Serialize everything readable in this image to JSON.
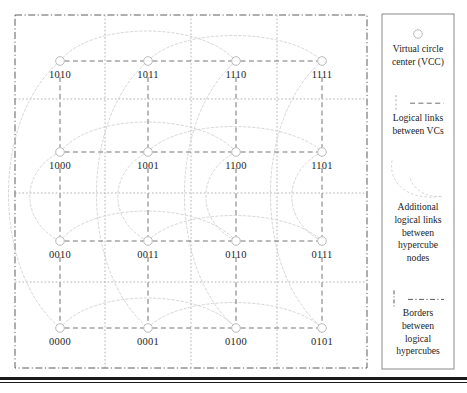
{
  "figure": {
    "type": "network-diagram",
    "title": ""
  },
  "diagram": {
    "grid": {
      "columns": 4,
      "rows": 4,
      "node_x": [
        60,
        148,
        236,
        322
      ],
      "node_y": [
        61,
        152,
        241,
        328
      ],
      "border_box": {
        "x": 15,
        "y": 15,
        "width": 352,
        "height": 353
      },
      "hypercube_border_vlines": [
        105,
        191,
        277
      ],
      "hypercube_border_hlines": [
        99,
        193,
        282
      ]
    },
    "nodes": [
      {
        "id": "1010",
        "label": "1010",
        "col": 0,
        "row": 0
      },
      {
        "id": "1011",
        "label": "1011",
        "col": 1,
        "row": 0
      },
      {
        "id": "1110",
        "label": "1110",
        "col": 2,
        "row": 0
      },
      {
        "id": "1111",
        "label": "1111",
        "col": 3,
        "row": 0
      },
      {
        "id": "1000",
        "label": "1000",
        "col": 0,
        "row": 1
      },
      {
        "id": "1001",
        "label": "1001",
        "col": 1,
        "row": 1
      },
      {
        "id": "1100",
        "label": "1100",
        "col": 2,
        "row": 1
      },
      {
        "id": "1101",
        "label": "1101",
        "col": 3,
        "row": 1
      },
      {
        "id": "0010",
        "label": "0010",
        "col": 0,
        "row": 2
      },
      {
        "id": "0011",
        "label": "0011",
        "col": 1,
        "row": 2
      },
      {
        "id": "0110",
        "label": "0110",
        "col": 2,
        "row": 2
      },
      {
        "id": "0111",
        "label": "0111",
        "col": 3,
        "row": 2
      },
      {
        "id": "0000",
        "label": "0000",
        "col": 0,
        "row": 3
      },
      {
        "id": "0001",
        "label": "0001",
        "col": 1,
        "row": 3
      },
      {
        "id": "0100",
        "label": "0100",
        "col": 2,
        "row": 3
      },
      {
        "id": "0101",
        "label": "0101",
        "col": 3,
        "row": 3
      }
    ],
    "logical_links_rows": [
      [
        "1010",
        "1011",
        "1110",
        "1111"
      ],
      [
        "1000",
        "1001",
        "1100",
        "1101"
      ],
      [
        "0010",
        "0011",
        "0110",
        "0111"
      ],
      [
        "0000",
        "0001",
        "0100",
        "0101"
      ]
    ],
    "logical_links_cols": [
      [
        "1010",
        "1000",
        "0010",
        "0000"
      ],
      [
        "1011",
        "1001",
        "0011",
        "0001"
      ],
      [
        "1110",
        "1100",
        "0110",
        "0100"
      ],
      [
        "1111",
        "1101",
        "0111",
        "0101"
      ]
    ],
    "additional_links": [
      {
        "from": "1010",
        "to": "1110",
        "shape": "arc-over"
      },
      {
        "from": "1011",
        "to": "1111",
        "shape": "arc-over"
      },
      {
        "from": "1000",
        "to": "1100",
        "shape": "arc-over"
      },
      {
        "from": "1001",
        "to": "1101",
        "shape": "arc-over"
      },
      {
        "from": "0010",
        "to": "0110",
        "shape": "arc-over"
      },
      {
        "from": "0011",
        "to": "0111",
        "shape": "arc-over"
      },
      {
        "from": "0000",
        "to": "0100",
        "shape": "arc-over"
      },
      {
        "from": "0001",
        "to": "0101",
        "shape": "arc-over"
      },
      {
        "from": "1010",
        "to": "0000",
        "shape": "arc-left"
      },
      {
        "from": "1000",
        "to": "0010",
        "shape": "arc-left"
      },
      {
        "from": "1011",
        "to": "0001",
        "shape": "arc-left"
      },
      {
        "from": "1001",
        "to": "0011",
        "shape": "arc-left"
      },
      {
        "from": "1110",
        "to": "0100",
        "shape": "arc-left"
      },
      {
        "from": "1100",
        "to": "0110",
        "shape": "arc-left"
      },
      {
        "from": "1111",
        "to": "0101",
        "shape": "arc-left"
      },
      {
        "from": "1101",
        "to": "0111",
        "shape": "arc-left"
      }
    ]
  },
  "legend": {
    "box": {
      "x": 382,
      "y": 14,
      "width": 72,
      "height": 355
    },
    "entries": [
      {
        "id": "vcc",
        "symbol": "circle-marker",
        "lines": [
          "Virtual circle",
          "center (VCC)"
        ]
      },
      {
        "id": "logical-links",
        "symbol": "dashed-line",
        "lines": [
          "Logical links",
          "between VCs"
        ]
      },
      {
        "id": "additional-links",
        "symbol": "curved-arc",
        "lines": [
          "Additional",
          "logical links",
          "between",
          "hypercube",
          "nodes"
        ]
      },
      {
        "id": "borders",
        "symbol": "dash-dot-line",
        "lines": [
          "Borders",
          "between",
          "logical",
          "hypercubes"
        ]
      }
    ]
  },
  "colors": {
    "node_stroke": "#b9b9b9",
    "node_fill": "#ffffff",
    "logical_link": "#6e6e6e",
    "additional_link": "#cfcfcf",
    "hypercube_border": "#9a9a9a",
    "outer_border": "#4a4a4a",
    "legend_border": "#7d7d7d",
    "text": "#1d1d1d",
    "bottom_rule": "#1a1a1a"
  }
}
